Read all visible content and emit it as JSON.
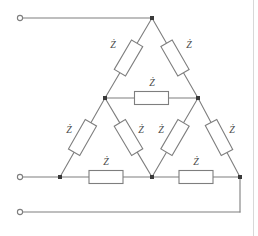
{
  "figure": {
    "kind": "circuit-schematic",
    "canvas": {
      "width": 258,
      "height": 236,
      "background": "#ffffff"
    },
    "colors": {
      "wire": "#7e7e7e",
      "node": "#3a3a3a",
      "label": "#4a4a4a",
      "resistor_fill": "#ffffff",
      "page_edge": "#d8d8d8"
    },
    "label_text": "Ż",
    "impedance_count": 9,
    "terminal_count": 3
  },
  "nodes": [
    {
      "id": "apex",
      "name": "top-apex-node",
      "x": 152,
      "y": 18,
      "dot": true
    },
    {
      "id": "mid-left",
      "name": "inner-left-node",
      "x": 105,
      "y": 98,
      "dot": true
    },
    {
      "id": "mid-right",
      "name": "inner-right-node",
      "x": 198,
      "y": 98,
      "dot": true
    },
    {
      "id": "bot-left",
      "name": "bottom-left-node",
      "x": 60,
      "y": 177,
      "dot": true
    },
    {
      "id": "bot-center",
      "name": "bottom-center-node",
      "x": 152,
      "y": 177,
      "dot": true
    },
    {
      "id": "bot-right",
      "name": "bottom-right-node",
      "x": 240,
      "y": 177,
      "dot": true
    }
  ],
  "terminals": [
    {
      "id": "t1",
      "name": "terminal-line-1",
      "x": 20,
      "y": 18,
      "radius": 2.6
    },
    {
      "id": "t2",
      "name": "terminal-line-2",
      "x": 20,
      "y": 177,
      "radius": 2.6
    },
    {
      "id": "t3",
      "name": "terminal-line-3",
      "x": 20,
      "y": 212,
      "radius": 2.6
    }
  ],
  "wires": [
    {
      "id": "w1",
      "name": "wire-terminal1-to-apex",
      "x1": 22,
      "y1": 18,
      "x2": 152,
      "y2": 18
    },
    {
      "id": "w2",
      "name": "wire-terminal2-to-bottom-left",
      "x1": 22,
      "y1": 177,
      "x2": 60,
      "y2": 177
    },
    {
      "id": "w3",
      "name": "wire-terminal3-run",
      "x1": 22,
      "y1": 212,
      "x2": 240,
      "y2": 212
    },
    {
      "id": "w4",
      "name": "wire-bottom-right-riser",
      "x1": 240,
      "y1": 212,
      "x2": 240,
      "y2": 177
    }
  ],
  "impedances": [
    {
      "id": "z1",
      "name": "impedance-apex-to-inner-left",
      "x1": 152,
      "y1": 18,
      "x2": 105,
      "y2": 98,
      "label": "Ż",
      "label_x": 113,
      "label_y": 46
    },
    {
      "id": "z2",
      "name": "impedance-apex-to-inner-right",
      "x1": 152,
      "y1": 18,
      "x2": 198,
      "y2": 98,
      "label": "Ż",
      "label_x": 189,
      "label_y": 46
    },
    {
      "id": "z3",
      "name": "impedance-inner-left-to-inner-right",
      "x1": 105,
      "y1": 98,
      "x2": 198,
      "y2": 98,
      "label": "Ż",
      "label_x": 152,
      "label_y": 84
    },
    {
      "id": "z4",
      "name": "impedance-inner-left-to-bottom-left",
      "x1": 105,
      "y1": 98,
      "x2": 60,
      "y2": 177,
      "label": "Ż",
      "label_x": 69,
      "label_y": 131
    },
    {
      "id": "z5",
      "name": "impedance-inner-left-to-bottom-center",
      "x1": 105,
      "y1": 98,
      "x2": 152,
      "y2": 177,
      "label": "Ż",
      "label_x": 141,
      "label_y": 131
    },
    {
      "id": "z6",
      "name": "impedance-inner-right-to-bottom-center",
      "x1": 198,
      "y1": 98,
      "x2": 152,
      "y2": 177,
      "label": "Ż",
      "label_x": 161,
      "label_y": 131
    },
    {
      "id": "z7",
      "name": "impedance-inner-right-to-bottom-right",
      "x1": 198,
      "y1": 98,
      "x2": 240,
      "y2": 177,
      "label": "Ż",
      "label_x": 232,
      "label_y": 131
    },
    {
      "id": "z8",
      "name": "impedance-bottom-left-to-bottom-center",
      "x1": 60,
      "y1": 177,
      "x2": 152,
      "y2": 177,
      "label": "Ż",
      "label_x": 106,
      "label_y": 163
    },
    {
      "id": "z9",
      "name": "impedance-bottom-center-to-bottom-right",
      "x1": 152,
      "y1": 177,
      "x2": 240,
      "y2": 177,
      "label": "Ż",
      "label_x": 196,
      "label_y": 163
    }
  ],
  "resistor_box": {
    "length": 34,
    "width": 13
  }
}
